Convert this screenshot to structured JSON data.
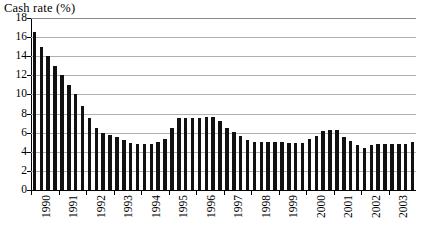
{
  "chart_data": {
    "type": "bar",
    "title": "Cash rate (%)",
    "xlabel": "",
    "ylabel": "",
    "ylim": [
      0,
      18
    ],
    "y_ticks": [
      0,
      2,
      4,
      6,
      8,
      10,
      12,
      14,
      16,
      18
    ],
    "grid": true,
    "legend": false,
    "bar_color": "#111111",
    "gridline_color": "#b0b0b0",
    "axis_color": "#000000",
    "x_tick_labels": [
      "1990",
      "1991",
      "1992",
      "1993",
      "1994",
      "1995",
      "1996",
      "1997",
      "1998",
      "1999",
      "2000",
      "2001",
      "2002",
      "2003"
    ],
    "frequency": "quarterly",
    "categories": [
      "1990 Q1",
      "1990 Q2",
      "1990 Q3",
      "1990 Q4",
      "1991 Q1",
      "1991 Q2",
      "1991 Q3",
      "1991 Q4",
      "1992 Q1",
      "1992 Q2",
      "1992 Q3",
      "1992 Q4",
      "1993 Q1",
      "1993 Q2",
      "1993 Q3",
      "1993 Q4",
      "1994 Q1",
      "1994 Q2",
      "1994 Q3",
      "1994 Q4",
      "1995 Q1",
      "1995 Q2",
      "1995 Q3",
      "1995 Q4",
      "1996 Q1",
      "1996 Q2",
      "1996 Q3",
      "1996 Q4",
      "1997 Q1",
      "1997 Q2",
      "1997 Q3",
      "1997 Q4",
      "1998 Q1",
      "1998 Q2",
      "1998 Q3",
      "1998 Q4",
      "1999 Q1",
      "1999 Q2",
      "1999 Q3",
      "1999 Q4",
      "2000 Q1",
      "2000 Q2",
      "2000 Q3",
      "2000 Q4",
      "2001 Q1",
      "2001 Q2",
      "2001 Q3",
      "2001 Q4",
      "2002 Q1",
      "2002 Q2",
      "2002 Q3",
      "2002 Q4",
      "2003 Q1",
      "2003 Q2",
      "2003 Q3",
      "2003 Q4"
    ],
    "values": [
      16.5,
      15.0,
      14.0,
      13.0,
      12.0,
      11.0,
      10.0,
      8.8,
      7.5,
      6.5,
      6.0,
      5.8,
      5.5,
      5.2,
      4.9,
      4.8,
      4.8,
      4.8,
      5.0,
      5.3,
      6.5,
      7.5,
      7.5,
      7.5,
      7.5,
      7.6,
      7.6,
      7.2,
      6.5,
      6.1,
      5.7,
      5.2,
      5.0,
      5.0,
      5.0,
      5.0,
      5.0,
      4.9,
      4.9,
      4.9,
      5.3,
      5.7,
      6.2,
      6.3,
      6.3,
      5.6,
      5.1,
      4.7,
      4.4,
      4.7,
      4.8,
      4.8,
      4.8,
      4.8,
      4.8,
      5.0
    ]
  }
}
